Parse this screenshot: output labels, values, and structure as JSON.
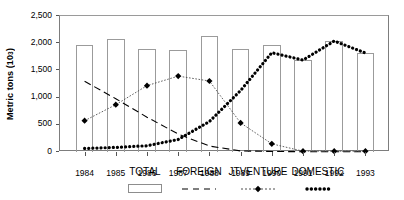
{
  "chart_data": {
    "type": "bar",
    "title": "",
    "xlabel": "",
    "ylabel": "Metric tons (10",
    "ylabel_sup": "3",
    "ylabel_suffix": ")",
    "categories": [
      "1984",
      "1985",
      "1986",
      "1987",
      "1988",
      "1989",
      "1990",
      "1991",
      "1992",
      "1993"
    ],
    "ylim": [
      0,
      2500
    ],
    "ytick_values": [
      0,
      500,
      1000,
      1500,
      2000,
      2500
    ],
    "ytick_labels": [
      "0",
      "500",
      "1,000",
      "1,500",
      "2,000",
      "2,500"
    ],
    "grid": false,
    "legend_position": "below",
    "series": [
      {
        "name": "TOTAL",
        "type": "bar",
        "values": [
          1960,
          2070,
          1890,
          1880,
          2130,
          1890,
          1965,
          1690,
          2040,
          1820
        ]
      },
      {
        "name": "FOREIGN",
        "type": "line",
        "style": "dashed",
        "values": [
          1300,
          980,
          640,
          330,
          110,
          20,
          10,
          5,
          5,
          5
        ]
      },
      {
        "name": "JTVENTURE",
        "type": "line",
        "style": "dotted-diamond",
        "values": [
          575,
          870,
          1220,
          1395,
          1305,
          535,
          150,
          15,
          15,
          15
        ]
      },
      {
        "name": "DOMESTIC",
        "type": "line",
        "style": "thick-dotted",
        "values": [
          65,
          85,
          115,
          230,
          560,
          1130,
          1825,
          1690,
          2040,
          1820
        ]
      }
    ]
  },
  "legend": {
    "items": [
      {
        "label": "TOTAL",
        "symbol": "open-rect-swatch"
      },
      {
        "label": "FOREIGN",
        "symbol": "dashed-line-swatch"
      },
      {
        "label": "JTVENTURE",
        "symbol": "diamond-marker-line-swatch"
      },
      {
        "label": "DOMESTIC",
        "symbol": "thick-dotted-line-swatch"
      }
    ]
  },
  "colors": {
    "axis": "#7d7d7d",
    "bar_outline": "#9b9b9b",
    "series_line": "#000000",
    "text": "#000000"
  }
}
